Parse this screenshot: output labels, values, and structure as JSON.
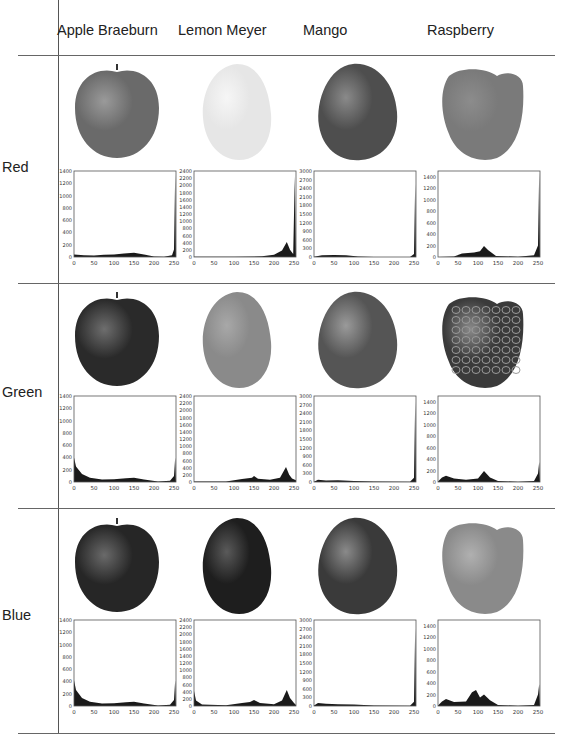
{
  "table": {
    "columns": [
      "Apple Braeburn",
      "Lemon Meyer",
      "Mango",
      "Raspberry"
    ],
    "rows": [
      "Red",
      "Green",
      "Blue"
    ]
  },
  "chart_data": [
    {
      "type": "bar",
      "channel": "Red",
      "fruit": "Apple Braeburn",
      "x_ticks": [
        0,
        50,
        100,
        150,
        200,
        250
      ],
      "y_ticks": [
        0,
        200,
        400,
        600,
        800,
        1000,
        1200,
        1400
      ],
      "ylim": [
        0,
        1400
      ],
      "xlim": [
        0,
        255
      ],
      "shape": [
        [
          0,
          40
        ],
        [
          25,
          30
        ],
        [
          50,
          25
        ],
        [
          75,
          35
        ],
        [
          100,
          40
        ],
        [
          125,
          55
        ],
        [
          150,
          70
        ],
        [
          175,
          40
        ],
        [
          200,
          10
        ],
        [
          225,
          5
        ],
        [
          245,
          30
        ],
        [
          250,
          120
        ],
        [
          253,
          1340
        ],
        [
          255,
          0
        ]
      ]
    },
    {
      "type": "bar",
      "channel": "Red",
      "fruit": "Lemon Meyer",
      "x_ticks": [
        0,
        50,
        100,
        150,
        200,
        250
      ],
      "y_ticks": [
        0,
        200,
        400,
        600,
        800,
        1000,
        1200,
        1400,
        1600,
        1800,
        2000,
        2200,
        2400
      ],
      "ylim": [
        0,
        2400
      ],
      "xlim": [
        0,
        255
      ],
      "shape": [
        [
          0,
          5
        ],
        [
          100,
          5
        ],
        [
          170,
          20
        ],
        [
          200,
          60
        ],
        [
          220,
          180
        ],
        [
          232,
          420
        ],
        [
          240,
          200
        ],
        [
          248,
          80
        ],
        [
          252,
          2250
        ],
        [
          255,
          0
        ]
      ]
    },
    {
      "type": "bar",
      "channel": "Red",
      "fruit": "Mango",
      "x_ticks": [
        0,
        50,
        100,
        150,
        200,
        250
      ],
      "y_ticks": [
        0,
        300,
        600,
        900,
        1200,
        1500,
        1800,
        2100,
        2400,
        2700,
        3000
      ],
      "ylim": [
        0,
        3000
      ],
      "xlim": [
        0,
        255
      ],
      "shape": [
        [
          0,
          10
        ],
        [
          20,
          60
        ],
        [
          50,
          70
        ],
        [
          80,
          60
        ],
        [
          110,
          20
        ],
        [
          150,
          5
        ],
        [
          240,
          5
        ],
        [
          250,
          100
        ],
        [
          253,
          2550
        ],
        [
          255,
          0
        ]
      ]
    },
    {
      "type": "bar",
      "channel": "Red",
      "fruit": "Raspberry",
      "x_ticks": [
        0,
        50,
        100,
        150,
        200,
        250
      ],
      "y_ticks": [
        0,
        200,
        400,
        600,
        800,
        1000,
        1200,
        1400
      ],
      "ylim": [
        0,
        1500
      ],
      "xlim": [
        0,
        255
      ],
      "shape": [
        [
          0,
          0
        ],
        [
          40,
          10
        ],
        [
          60,
          60
        ],
        [
          90,
          80
        ],
        [
          105,
          100
        ],
        [
          115,
          190
        ],
        [
          125,
          120
        ],
        [
          145,
          20
        ],
        [
          200,
          5
        ],
        [
          240,
          30
        ],
        [
          250,
          200
        ],
        [
          253,
          1480
        ],
        [
          255,
          0
        ]
      ]
    },
    {
      "type": "bar",
      "channel": "Green",
      "fruit": "Apple Braeburn",
      "x_ticks": [
        0,
        50,
        100,
        150,
        200,
        250
      ],
      "y_ticks": [
        0,
        200,
        400,
        600,
        800,
        1000,
        1200,
        1400
      ],
      "ylim": [
        0,
        1400
      ],
      "xlim": [
        0,
        255
      ],
      "shape": [
        [
          0,
          400
        ],
        [
          5,
          250
        ],
        [
          20,
          130
        ],
        [
          40,
          70
        ],
        [
          70,
          40
        ],
        [
          100,
          45
        ],
        [
          130,
          60
        ],
        [
          150,
          70
        ],
        [
          175,
          40
        ],
        [
          210,
          10
        ],
        [
          240,
          20
        ],
        [
          250,
          100
        ],
        [
          253,
          400
        ],
        [
          255,
          0
        ]
      ]
    },
    {
      "type": "bar",
      "channel": "Green",
      "fruit": "Lemon Meyer",
      "x_ticks": [
        0,
        50,
        100,
        150,
        200,
        250
      ],
      "y_ticks": [
        0,
        200,
        400,
        600,
        800,
        1000,
        1200,
        1400,
        1600,
        1800,
        2000,
        2200,
        2400
      ],
      "ylim": [
        0,
        2400
      ],
      "xlim": [
        0,
        255
      ],
      "shape": [
        [
          0,
          10
        ],
        [
          80,
          10
        ],
        [
          120,
          80
        ],
        [
          145,
          120
        ],
        [
          150,
          170
        ],
        [
          160,
          90
        ],
        [
          190,
          60
        ],
        [
          215,
          120
        ],
        [
          230,
          420
        ],
        [
          238,
          200
        ],
        [
          245,
          100
        ],
        [
          255,
          50
        ]
      ]
    },
    {
      "type": "bar",
      "channel": "Green",
      "fruit": "Mango",
      "x_ticks": [
        0,
        50,
        100,
        150,
        200,
        250
      ],
      "y_ticks": [
        0,
        300,
        600,
        900,
        1200,
        1500,
        1800,
        2100,
        2400,
        2700,
        3000
      ],
      "ylim": [
        0,
        3000
      ],
      "xlim": [
        0,
        255
      ],
      "shape": [
        [
          0,
          10
        ],
        [
          10,
          80
        ],
        [
          30,
          50
        ],
        [
          60,
          60
        ],
        [
          100,
          40
        ],
        [
          150,
          20
        ],
        [
          240,
          10
        ],
        [
          250,
          150
        ],
        [
          253,
          2800
        ],
        [
          255,
          0
        ]
      ]
    },
    {
      "type": "bar",
      "channel": "Green",
      "fruit": "Raspberry",
      "x_ticks": [
        0,
        50,
        100,
        150,
        200,
        250
      ],
      "y_ticks": [
        0,
        200,
        400,
        600,
        800,
        1000,
        1200,
        1400
      ],
      "ylim": [
        0,
        1500
      ],
      "xlim": [
        0,
        255
      ],
      "shape": [
        [
          0,
          10
        ],
        [
          10,
          80
        ],
        [
          20,
          110
        ],
        [
          40,
          60
        ],
        [
          70,
          40
        ],
        [
          100,
          60
        ],
        [
          115,
          190
        ],
        [
          130,
          80
        ],
        [
          150,
          20
        ],
        [
          200,
          5
        ],
        [
          240,
          20
        ],
        [
          250,
          150
        ],
        [
          253,
          350
        ],
        [
          255,
          0
        ]
      ]
    },
    {
      "type": "bar",
      "channel": "Blue",
      "fruit": "Apple Braeburn",
      "x_ticks": [
        0,
        50,
        100,
        150,
        200,
        250
      ],
      "y_ticks": [
        0,
        200,
        400,
        600,
        800,
        1000,
        1200,
        1400
      ],
      "ylim": [
        0,
        1400
      ],
      "xlim": [
        0,
        255
      ],
      "shape": [
        [
          0,
          420
        ],
        [
          5,
          260
        ],
        [
          20,
          130
        ],
        [
          40,
          70
        ],
        [
          70,
          40
        ],
        [
          100,
          45
        ],
        [
          130,
          60
        ],
        [
          150,
          70
        ],
        [
          175,
          40
        ],
        [
          210,
          10
        ],
        [
          240,
          20
        ],
        [
          250,
          100
        ],
        [
          253,
          420
        ],
        [
          255,
          0
        ]
      ]
    },
    {
      "type": "bar",
      "channel": "Blue",
      "fruit": "Lemon Meyer",
      "x_ticks": [
        0,
        50,
        100,
        150,
        200,
        250
      ],
      "y_ticks": [
        0,
        200,
        400,
        600,
        800,
        1000,
        1200,
        1400,
        1600,
        1800,
        2000,
        2200,
        2400
      ],
      "ylim": [
        0,
        2400
      ],
      "xlim": [
        0,
        255
      ],
      "shape": [
        [
          0,
          420
        ],
        [
          5,
          150
        ],
        [
          20,
          40
        ],
        [
          80,
          20
        ],
        [
          120,
          80
        ],
        [
          140,
          110
        ],
        [
          150,
          170
        ],
        [
          165,
          80
        ],
        [
          200,
          50
        ],
        [
          220,
          150
        ],
        [
          232,
          450
        ],
        [
          240,
          220
        ],
        [
          250,
          80
        ],
        [
          255,
          30
        ]
      ]
    },
    {
      "type": "bar",
      "channel": "Blue",
      "fruit": "Mango",
      "x_ticks": [
        0,
        50,
        100,
        150,
        200,
        250
      ],
      "y_ticks": [
        0,
        300,
        600,
        900,
        1200,
        1500,
        1800,
        2100,
        2400,
        2700,
        3000
      ],
      "ylim": [
        0,
        3000
      ],
      "xlim": [
        0,
        255
      ],
      "shape": [
        [
          0,
          20
        ],
        [
          10,
          100
        ],
        [
          30,
          80
        ],
        [
          60,
          60
        ],
        [
          100,
          50
        ],
        [
          150,
          20
        ],
        [
          240,
          10
        ],
        [
          250,
          150
        ],
        [
          253,
          2700
        ],
        [
          255,
          0
        ]
      ]
    },
    {
      "type": "bar",
      "channel": "Blue",
      "fruit": "Raspberry",
      "x_ticks": [
        0,
        50,
        100,
        150,
        200,
        250
      ],
      "y_ticks": [
        0,
        200,
        400,
        600,
        800,
        1000,
        1200,
        1400
      ],
      "ylim": [
        0,
        1500
      ],
      "xlim": [
        0,
        255
      ],
      "shape": [
        [
          0,
          10
        ],
        [
          10,
          80
        ],
        [
          20,
          120
        ],
        [
          40,
          70
        ],
        [
          70,
          80
        ],
        [
          85,
          240
        ],
        [
          95,
          280
        ],
        [
          105,
          150
        ],
        [
          115,
          200
        ],
        [
          130,
          100
        ],
        [
          150,
          20
        ],
        [
          200,
          5
        ],
        [
          240,
          20
        ],
        [
          250,
          200
        ],
        [
          253,
          380
        ],
        [
          255,
          0
        ]
      ]
    }
  ],
  "fruit_images": [
    {
      "row": "Red",
      "fruit": "Apple Braeburn",
      "shape": "apple",
      "fill": "#6a6a6a",
      "highlight": "#9a9a9a"
    },
    {
      "row": "Red",
      "fruit": "Lemon Meyer",
      "shape": "lemon",
      "fill": "#e6e6e6",
      "highlight": "#f6f6f6"
    },
    {
      "row": "Red",
      "fruit": "Mango",
      "shape": "mango",
      "fill": "#4e4e4e",
      "highlight": "#8a8a8a"
    },
    {
      "row": "Red",
      "fruit": "Raspberry",
      "shape": "raspberry",
      "fill": "#7a7a7a",
      "highlight": "#8c8c8c"
    },
    {
      "row": "Green",
      "fruit": "Apple Braeburn",
      "shape": "apple",
      "fill": "#2a2a2a",
      "highlight": "#6e6e6e"
    },
    {
      "row": "Green",
      "fruit": "Lemon Meyer",
      "shape": "lemon",
      "fill": "#8a8a8a",
      "highlight": "#a8a8a8"
    },
    {
      "row": "Green",
      "fruit": "Mango",
      "shape": "mango",
      "fill": "#555555",
      "highlight": "#9a9a9a"
    },
    {
      "row": "Green",
      "fruit": "Raspberry",
      "shape": "raspberry",
      "fill": "#3a3a3a",
      "highlight": "#8a8a8a"
    },
    {
      "row": "Blue",
      "fruit": "Apple Braeburn",
      "shape": "apple",
      "fill": "#262626",
      "highlight": "#6a6a6a"
    },
    {
      "row": "Blue",
      "fruit": "Lemon Meyer",
      "shape": "lemon",
      "fill": "#1e1e1e",
      "highlight": "#5a5a5a"
    },
    {
      "row": "Blue",
      "fruit": "Mango",
      "shape": "mango",
      "fill": "#3a3a3a",
      "highlight": "#8a8a8a"
    },
    {
      "row": "Blue",
      "fruit": "Raspberry",
      "shape": "raspberry",
      "fill": "#8a8a8a",
      "highlight": "#b0b0b0"
    }
  ]
}
